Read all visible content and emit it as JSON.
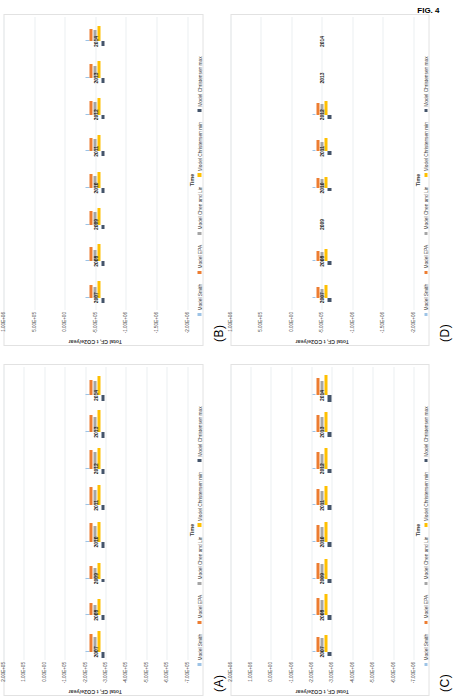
{
  "figure": {
    "caption": "FIG. 4",
    "series_colors": {
      "Model Smith": "#9dc3e6",
      "Model EPA": "#ed7d31",
      "Model Chen and Lin": "#a5a5a5",
      "Model Christensen min": "#ffc000",
      "Model Christensen max": "#44546a"
    },
    "series_order": [
      "Model Smith",
      "Model EPA",
      "Model Chen and Lin",
      "Model Christensen min",
      "Model Christensen max"
    ]
  },
  "chart_data": [
    {
      "panel": "(A)",
      "type": "bar",
      "orientation": "horizontal-grouped",
      "title": "",
      "xlabel": "Time",
      "ylabel": "Total CF, t CO2e/year",
      "categories": [
        "2007",
        "2008",
        "2009",
        "2010",
        "2011",
        "2012",
        "2013",
        "2014"
      ],
      "ytick_labels": [
        "2.00E+05",
        "1.00E+05",
        "0.00E+00",
        "-1.00E+05",
        "-2.00E+05",
        "-3.00E+05",
        "-4.00E+05",
        "-5.00E+05",
        "-6.00E+05",
        "-7.00E+05"
      ],
      "ylim": [
        -700000,
        200000
      ],
      "grid": true,
      "legend_position": "bottom",
      "series": [
        {
          "name": "Model Smith",
          "values": [
            -20000,
            -18000,
            -16000,
            -22000,
            -20000,
            -22000,
            -22000,
            -20000
          ]
        },
        {
          "name": "Model EPA",
          "values": [
            -430000,
            -290000,
            -300000,
            -455000,
            -440000,
            -455000,
            -430000,
            -390000
          ]
        },
        {
          "name": "Model Chen and Lin",
          "values": [
            -360000,
            -255000,
            -270000,
            -400000,
            -385000,
            -400000,
            -380000,
            -345000
          ]
        },
        {
          "name": "Model Christensen min",
          "values": [
            -520000,
            -400000,
            -390000,
            -500000,
            -495000,
            -520000,
            -540000,
            -490000
          ]
        },
        {
          "name": "Model Christensen max",
          "values": [
            150000,
            105000,
            80000,
            140000,
            120000,
            140000,
            145000,
            130000
          ]
        }
      ]
    },
    {
      "panel": "(B)",
      "type": "bar",
      "orientation": "horizontal-grouped",
      "title": "",
      "xlabel": "Time",
      "ylabel": "Total CF, t CO2e/year",
      "categories": [
        "2007",
        "2008",
        "2009",
        "2010",
        "2011",
        "2012",
        "2013",
        "2014"
      ],
      "ytick_labels": [
        "1.00E+06",
        "5.00E+05",
        "0.00E+00",
        "-5.00E+05",
        "-1.00E+06",
        "-1.50E+06",
        "-2.00E+06"
      ],
      "ylim": [
        -2000000,
        1000000
      ],
      "grid": true,
      "legend_position": "bottom",
      "series": [
        {
          "name": "Model Smith",
          "values": [
            -60000,
            -60000,
            -55000,
            -60000,
            -60000,
            -60000,
            -60000,
            -55000
          ]
        },
        {
          "name": "Model EPA",
          "values": [
            -1080000,
            -1170000,
            -1120000,
            -1100000,
            -1090000,
            -1110000,
            -1120000,
            -1000000
          ]
        },
        {
          "name": "Model Chen and Lin",
          "values": [
            -900000,
            -950000,
            -1000000,
            -1000000,
            -1000000,
            -1000000,
            -980000,
            -900000
          ]
        },
        {
          "name": "Model Christensen min",
          "values": [
            -1350000,
            -1420000,
            -1360000,
            -1340000,
            -1340000,
            -1360000,
            -1370000,
            -1240000
          ]
        },
        {
          "name": "Model Christensen max",
          "values": [
            390000,
            395000,
            380000,
            400000,
            420000,
            395000,
            395000,
            370000
          ]
        }
      ]
    },
    {
      "panel": "(C)",
      "type": "bar",
      "orientation": "horizontal-grouped",
      "title": "",
      "xlabel": "Time",
      "ylabel": "Total CF, t CO2e/year",
      "categories": [
        "2007",
        "2008",
        "2009",
        "2010",
        "2011",
        "2012",
        "2013",
        "2014"
      ],
      "ytick_labels": [
        "2.00E+06",
        "1.00E+06",
        "0.00E+00",
        "-1.00E+06",
        "-2.00E+06",
        "-3.00E+06",
        "-4.00E+06",
        "-5.00E+06",
        "-6.00E+06",
        "-7.00E+06"
      ],
      "ylim": [
        -7000000,
        2000000
      ],
      "grid": true,
      "legend_position": "bottom",
      "series": [
        {
          "name": "Model Smith",
          "values": [
            -250000,
            -230000,
            -180000,
            -200000,
            -180000,
            -200000,
            -200000,
            -190000
          ]
        },
        {
          "name": "Model EPA",
          "values": [
            -3700000,
            -4300000,
            -3900000,
            -4200000,
            -4100000,
            -4200000,
            -4150000,
            -4250000
          ]
        },
        {
          "name": "Model Chen and Lin",
          "values": [
            -3300000,
            -3750000,
            -3500000,
            -3700000,
            -3600000,
            -3600000,
            -3650000,
            -3650000
          ]
        },
        {
          "name": "Model Christensen min",
          "values": [
            -4250000,
            -5200000,
            -4700000,
            -5000000,
            -4850000,
            -5000000,
            -4900000,
            -5100000
          ]
        },
        {
          "name": "Model Christensen max",
          "values": [
            1000000,
            1150000,
            1050000,
            1150000,
            1100000,
            1100000,
            1100000,
            1600000
          ]
        }
      ]
    },
    {
      "panel": "(D)",
      "type": "bar",
      "orientation": "horizontal-grouped",
      "title": "",
      "xlabel": "Time",
      "ylabel": "Total CF, t CO2e/year",
      "categories": [
        "2007",
        "2008",
        "2009",
        "2010",
        "2011",
        "2012",
        "2013",
        "2014"
      ],
      "ytick_labels": [
        "1.00E+06",
        "5.00E+05",
        "0.00E+00",
        "-5.00E+05",
        "-1.00E+06",
        "-1.50E+06",
        "-2.00E+06"
      ],
      "ylim": [
        -2000000,
        1000000
      ],
      "grid": true,
      "legend_position": "bottom",
      "series": [
        {
          "name": "Model Smith",
          "values": [
            -60000,
            -60000,
            0,
            -60000,
            -70000,
            -80000,
            0,
            0
          ]
        },
        {
          "name": "Model EPA",
          "values": [
            -870000,
            -840000,
            0,
            -790000,
            -890000,
            -950000,
            0,
            0
          ]
        },
        {
          "name": "Model Chen and Lin",
          "values": [
            -730000,
            -760000,
            0,
            -690000,
            -800000,
            -870000,
            0,
            0
          ]
        },
        {
          "name": "Model Christensen min",
          "values": [
            -1080000,
            -1030000,
            0,
            -920000,
            -1070000,
            -1150000,
            0,
            0
          ]
        },
        {
          "name": "Model Christensen max",
          "values": [
            350000,
            310000,
            0,
            290000,
            330000,
            340000,
            0,
            0
          ]
        }
      ]
    }
  ]
}
